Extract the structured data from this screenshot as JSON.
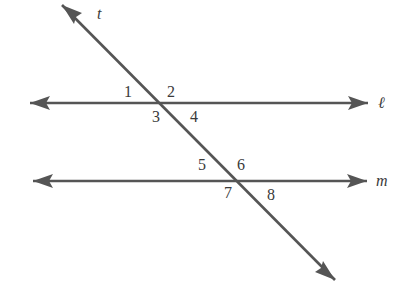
{
  "diagram": {
    "stroke_color": "#555555",
    "lines": {
      "l": {
        "label": "ℓ",
        "y": 103,
        "x1": 30,
        "x2": 368
      },
      "m": {
        "label": "m",
        "y": 181,
        "x1": 33,
        "x2": 367
      },
      "t": {
        "label": "t",
        "x1": 62,
        "y1": 5,
        "x2": 335,
        "y2": 280
      }
    },
    "angles": [
      {
        "label": "1",
        "x": 124,
        "y": 97
      },
      {
        "label": "2",
        "x": 167,
        "y": 97
      },
      {
        "label": "3",
        "x": 152,
        "y": 122
      },
      {
        "label": "4",
        "x": 190,
        "y": 122
      },
      {
        "label": "5",
        "x": 198,
        "y": 170
      },
      {
        "label": "6",
        "x": 237,
        "y": 170
      },
      {
        "label": "7",
        "x": 224,
        "y": 198
      },
      {
        "label": "8",
        "x": 267,
        "y": 200
      }
    ]
  }
}
